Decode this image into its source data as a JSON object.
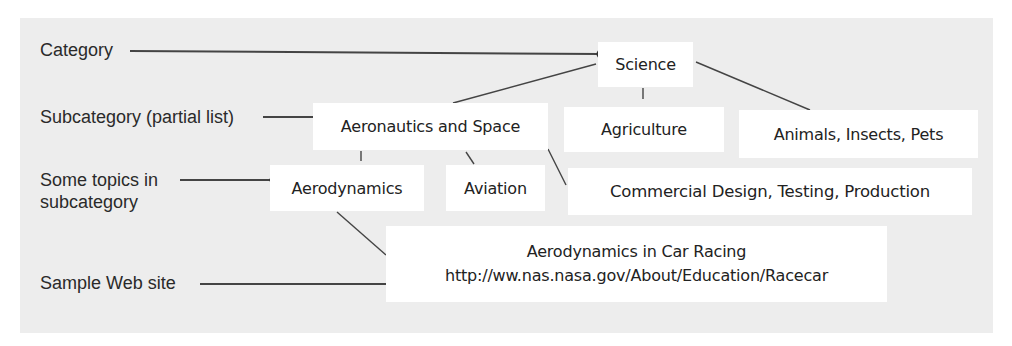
{
  "legend": {
    "category": "Category",
    "subcategory": "Subcategory (partial list)",
    "topics_line1": "Some topics in",
    "topics_line2": "subcategory",
    "website": "Sample Web site"
  },
  "hierarchy": {
    "category": "Science",
    "subcategories": [
      "Aeronautics and Space",
      "Agriculture",
      "Animals, Insects, Pets"
    ],
    "topics": [
      "Aerodynamics",
      "Aviation",
      "Commercial Design, Testing, Production"
    ],
    "website": {
      "title": "Aerodynamics in Car Racing",
      "url": "http://ww.nas.nasa.gov/About/Education/Racecar"
    }
  },
  "colors": {
    "panel_bg": "#ededed",
    "box_bg": "#ffffff",
    "line": "#333333"
  }
}
